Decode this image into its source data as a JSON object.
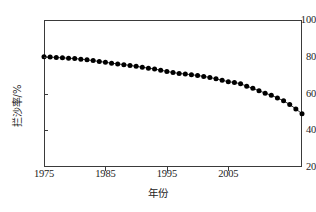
{
  "chart_data": {
    "type": "line",
    "title": "",
    "xlabel": "年份",
    "ylabel": "拦沙率/%",
    "xlim": [
      1975,
      2017
    ],
    "ylim": [
      20,
      100
    ],
    "xticks": [
      1975,
      1985,
      1995,
      2005
    ],
    "xtick_labels": [
      "1975",
      "1985",
      "1995",
      "2005"
    ],
    "yticks": [
      20,
      40,
      60,
      80,
      100
    ],
    "ytick_labels": [
      "20",
      "40",
      "60",
      "80",
      "100"
    ],
    "grid": false,
    "legend": "none",
    "marker": "filled-circle",
    "marker_color": "#000000",
    "line_color": "#000000",
    "x": [
      1975,
      1976,
      1977,
      1978,
      1979,
      1980,
      1981,
      1982,
      1983,
      1984,
      1985,
      1986,
      1987,
      1988,
      1989,
      1990,
      1991,
      1992,
      1993,
      1994,
      1995,
      1996,
      1997,
      1998,
      1999,
      2000,
      2001,
      2002,
      2003,
      2004,
      2005,
      2006,
      2007,
      2008,
      2009,
      2010,
      2011,
      2012,
      2013,
      2014,
      2015,
      2016,
      2017
    ],
    "values": [
      80.0,
      79.8,
      79.6,
      79.4,
      79.2,
      79.0,
      78.7,
      78.3,
      77.9,
      77.4,
      77.0,
      76.5,
      76.1,
      75.7,
      75.3,
      74.8,
      74.3,
      73.8,
      73.3,
      72.7,
      72.0,
      71.4,
      70.9,
      70.6,
      70.2,
      69.8,
      69.3,
      68.7,
      68.0,
      67.2,
      66.4,
      66.0,
      65.3,
      64.0,
      62.8,
      61.5,
      60.2,
      59.0,
      57.6,
      56.0,
      54.0,
      51.6,
      49.0
    ]
  }
}
